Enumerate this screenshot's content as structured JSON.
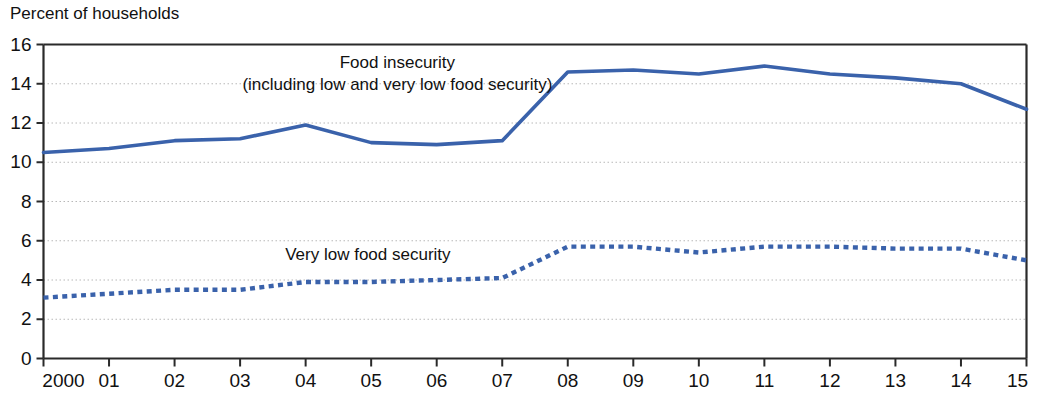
{
  "chart_data": {
    "type": "line",
    "title": "Percent of households",
    "xlabel": "",
    "ylabel": "Percent of households",
    "grid": true,
    "legend_position": "inline-annotations",
    "categories": [
      "2000",
      "01",
      "02",
      "03",
      "04",
      "05",
      "06",
      "07",
      "08",
      "09",
      "10",
      "11",
      "12",
      "13",
      "14",
      "15"
    ],
    "x_tick_labels": [
      "2000",
      "01",
      "02",
      "03",
      "04",
      "05",
      "06",
      "07",
      "08",
      "09",
      "10",
      "11",
      "12",
      "13",
      "14",
      "15"
    ],
    "y_tick_labels": [
      "0",
      "2",
      "4",
      "6",
      "8",
      "10",
      "12",
      "14",
      "16"
    ],
    "y_ticks": [
      0,
      2,
      4,
      6,
      8,
      10,
      12,
      14,
      16
    ],
    "ylim": [
      0,
      16
    ],
    "xlim": [
      2000,
      2015
    ],
    "series": [
      {
        "name": "Food insecurity (including low and very low food security)",
        "annotation_line_1": "Food insecurity",
        "annotation_line_2": "(including low and very low food security)",
        "style": "solid",
        "color": "#3a62ab",
        "values": [
          10.5,
          10.7,
          11.1,
          11.2,
          11.9,
          11.0,
          10.9,
          11.1,
          14.6,
          14.7,
          14.5,
          14.9,
          14.5,
          14.3,
          14.0,
          12.7
        ]
      },
      {
        "name": "Very low food security",
        "annotation_line_1": "Very low food security",
        "style": "dotted",
        "color": "#3a62ab",
        "values": [
          3.1,
          3.3,
          3.5,
          3.5,
          3.9,
          3.9,
          4.0,
          4.1,
          5.7,
          5.7,
          5.4,
          5.7,
          5.7,
          5.6,
          5.6,
          5.0
        ]
      }
    ],
    "annotations": [
      {
        "id": "food-insecurity-label",
        "text": "Food insecurity",
        "x_pct": 36,
        "y_value": 14.8
      },
      {
        "id": "food-insecurity-sublabel",
        "text": "(including low and very low food security)",
        "x_pct": 36,
        "y_value": 13.7
      },
      {
        "id": "very-low-food-security-label",
        "text": "Very low food security",
        "x_pct": 33,
        "y_value": 5.0
      }
    ],
    "colors": {
      "series_blue": "#3a62ab",
      "gridline": "#b8b8b8",
      "frame": "#2a2a2a",
      "text": "#111111",
      "background": "#ffffff"
    }
  }
}
